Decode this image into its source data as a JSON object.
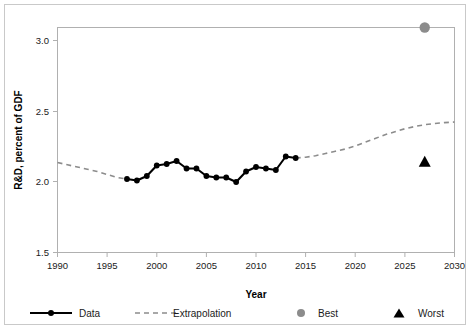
{
  "chart_data": {
    "type": "line",
    "title": "",
    "xlabel": "Year",
    "ylabel": "R&D, percent of GDF",
    "xlim": [
      1990,
      2030
    ],
    "ylim": [
      1.5,
      3.0
    ],
    "xticks": [
      1990,
      1995,
      2000,
      2005,
      2010,
      2015,
      2020,
      2025,
      2030
    ],
    "xtick_labels": [
      "1990",
      "1995",
      "2000",
      "2005",
      "2010",
      "2015",
      "2020",
      "2025",
      "2030"
    ],
    "yticks": [
      1.5,
      2.0,
      2.5,
      3.0
    ],
    "ytick_labels": [
      "1.5",
      "2.0",
      "2.5",
      "3.0"
    ],
    "grid": false,
    "legend_position": "bottom",
    "series": [
      {
        "name": "Data",
        "style": "solid-line-with-markers",
        "color": "#000000",
        "marker": "circle",
        "x": [
          1997,
          1998,
          1999,
          2000,
          2001,
          2002,
          2003,
          2004,
          2005,
          2006,
          2007,
          2008,
          2009,
          2010,
          2011,
          2012,
          2013,
          2014
        ],
        "values": [
          1.99,
          1.98,
          2.01,
          2.08,
          2.09,
          2.11,
          2.06,
          2.06,
          2.01,
          2.0,
          2.0,
          1.97,
          2.04,
          2.07,
          2.06,
          2.05,
          2.14,
          2.13
        ]
      },
      {
        "name": "Extrapolation",
        "style": "dashed-line",
        "color": "#8c8c8c",
        "marker": "none",
        "x": [
          1990,
          1991,
          1992,
          1993,
          1994,
          1995,
          1996,
          1997,
          2014,
          2015,
          2016,
          2017,
          2018,
          2019,
          2020,
          2021,
          2022,
          2023,
          2024,
          2025,
          2026,
          2027,
          2028,
          2029,
          2030
        ],
        "values": [
          2.1,
          2.085,
          2.07,
          2.055,
          2.04,
          2.02,
          2.0,
          1.99,
          2.13,
          2.135,
          2.145,
          2.16,
          2.175,
          2.19,
          2.21,
          2.235,
          2.26,
          2.285,
          2.305,
          2.325,
          2.34,
          2.352,
          2.36,
          2.366,
          2.37
        ]
      }
    ],
    "point_markers": [
      {
        "name": "Best",
        "marker": "circle",
        "color": "#8c8c8c",
        "x": 2027,
        "y": 3.0
      },
      {
        "name": "Worst",
        "marker": "triangle",
        "color": "#000000",
        "x": 2027,
        "y": 2.1
      }
    ],
    "legend": [
      {
        "label": "Data",
        "marker": "line-circle",
        "color": "#000000"
      },
      {
        "label": "Extrapolation",
        "marker": "dashed-line",
        "color": "#8c8c8c"
      },
      {
        "label": "Best",
        "marker": "circle",
        "color": "#8c8c8c"
      },
      {
        "label": "Worst",
        "marker": "triangle",
        "color": "#000000"
      }
    ]
  },
  "axis": {
    "ylabel": "R&D, percent of GDF",
    "xlabel": "Year",
    "ytick_labels": [
      "3.0",
      "2.5",
      "2.0",
      "1.5"
    ],
    "xtick_labels": [
      "1990",
      "1995",
      "2000",
      "2005",
      "2010",
      "2015",
      "2020",
      "2025",
      "2030"
    ]
  },
  "legend": {
    "data_label": "Data",
    "extrapolation_label": "Extrapolation",
    "best_label": "Best",
    "worst_label": "Worst"
  },
  "colors": {
    "series_data": "#000000",
    "series_extrapolation": "#8c8c8c",
    "best_marker": "#8c8c8c",
    "worst_marker": "#000000",
    "frame": "#b0b0b0",
    "outer_border": "#c9c9c9",
    "text": "#1a1a1a"
  }
}
